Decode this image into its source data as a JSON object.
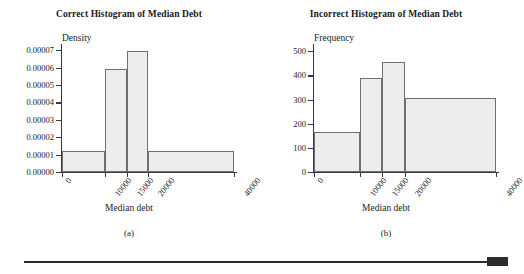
{
  "figure": {
    "panels": [
      {
        "id": "a",
        "title": "Correct Histogram of Median Debt",
        "caption": "(a)",
        "xlabel": "Median debt",
        "ylabel": "Density"
      },
      {
        "id": "b",
        "title": "Incorrect Histogram of Median Debt",
        "caption": "(b)",
        "xlabel": "Median debt",
        "ylabel": "Frequency"
      }
    ]
  },
  "chart_data": [
    {
      "type": "bar",
      "title": "Correct Histogram of Median Debt",
      "subtitle": "(a)",
      "xlabel": "Median debt",
      "ylabel": "Density",
      "xticks": [
        0,
        10000,
        15000,
        20000,
        40000
      ],
      "xticklabels": [
        "0",
        "10000",
        "15000",
        "20000",
        "40000"
      ],
      "yticks": [
        0.0,
        1e-05,
        2e-05,
        3e-05,
        4e-05,
        5e-05,
        6e-05,
        7e-05
      ],
      "yticklabels": [
        "0.00000",
        "0.00001",
        "0.00002",
        "0.00003",
        "0.00004",
        "0.00005",
        "0.00006",
        "0.00007"
      ],
      "xlim": [
        0,
        40000
      ],
      "ylim": [
        0,
        7.35e-05
      ],
      "grid": false,
      "legend": false,
      "bins": [
        {
          "left": 0,
          "right": 10000,
          "value": 1.23e-05
        },
        {
          "left": 10000,
          "right": 15000,
          "value": 5.92e-05
        },
        {
          "left": 15000,
          "right": 20000,
          "value": 6.95e-05
        },
        {
          "left": 20000,
          "right": 40000,
          "value": 1.18e-05
        }
      ],
      "bar_color": "#ededed",
      "bar_edge_color": "#6f6f6f"
    },
    {
      "type": "bar",
      "title": "Incorrect Histogram of Median Debt",
      "subtitle": "(b)",
      "xlabel": "Median debt",
      "ylabel": "Frequency",
      "xticks": [
        0,
        10000,
        15000,
        20000,
        40000
      ],
      "xticklabels": [
        "0",
        "10000",
        "15000",
        "20000",
        "40000"
      ],
      "yticks": [
        0,
        100,
        200,
        300,
        400,
        500
      ],
      "yticklabels": [
        "0",
        "100",
        "200",
        "300",
        "400",
        "500"
      ],
      "xlim": [
        0,
        40000
      ],
      "ylim": [
        0,
        530
      ],
      "grid": false,
      "legend": false,
      "bins": [
        {
          "left": 0,
          "right": 10000,
          "value": 166
        },
        {
          "left": 10000,
          "right": 15000,
          "value": 390
        },
        {
          "left": 15000,
          "right": 20000,
          "value": 455
        },
        {
          "left": 20000,
          "right": 40000,
          "value": 308
        }
      ],
      "bar_color": "#ededed",
      "bar_edge_color": "#6f6f6f"
    }
  ],
  "footer": {
    "rule_color": "#2b2b30",
    "tab_color": "#2b2b30"
  }
}
